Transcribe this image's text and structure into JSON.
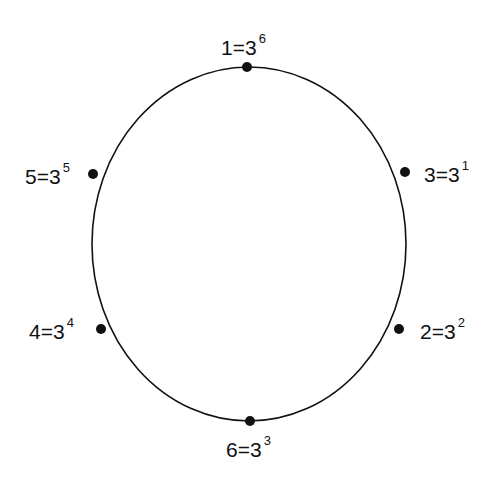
{
  "diagram": {
    "circle": {
      "cx": 249,
      "cy": 244,
      "rx": 157,
      "ry": 177,
      "stroke": "#111111"
    },
    "points": [
      {
        "id": "p1",
        "value": "1",
        "base": "3",
        "exp": "6",
        "x": 247,
        "y": 67,
        "lx": 221,
        "ly": 36,
        "anchor": "top"
      },
      {
        "id": "p3",
        "value": "3",
        "base": "3",
        "exp": "1",
        "x": 405,
        "y": 172,
        "lx": 424,
        "ly": 163,
        "anchor": "right"
      },
      {
        "id": "p2",
        "value": "2",
        "base": "3",
        "exp": "2",
        "x": 399,
        "y": 329,
        "lx": 420,
        "ly": 320,
        "anchor": "right"
      },
      {
        "id": "p6",
        "value": "6",
        "base": "3",
        "exp": "3",
        "x": 250,
        "y": 421,
        "lx": 226,
        "ly": 438,
        "anchor": "bottom"
      },
      {
        "id": "p4",
        "value": "4",
        "base": "3",
        "exp": "4",
        "x": 101,
        "y": 329,
        "lx": 29,
        "ly": 320,
        "anchor": "left"
      },
      {
        "id": "p5",
        "value": "5",
        "base": "3",
        "exp": "5",
        "x": 93,
        "y": 174,
        "lx": 25,
        "ly": 165,
        "anchor": "left"
      }
    ],
    "labels": {
      "p1": {
        "text": "1=3",
        "sup": "6"
      },
      "p3": {
        "text": "3=3",
        "sup": "1"
      },
      "p2": {
        "text": "2=3",
        "sup": "2"
      },
      "p6": {
        "text": "6=3",
        "sup": "3"
      },
      "p4": {
        "text": "4=3",
        "sup": "4"
      },
      "p5": {
        "text": "5=3",
        "sup": "5"
      }
    }
  }
}
